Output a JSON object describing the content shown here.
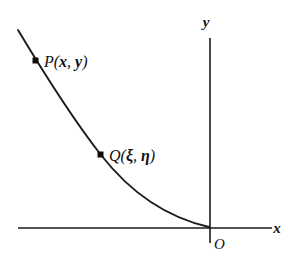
{
  "figure": {
    "background_color": "#ffffff",
    "ink_color": "#1a1a1a",
    "axes": {
      "x_axis_label": "x",
      "y_axis_label": "y",
      "origin_label": "O"
    },
    "curve": {
      "description": "decreasing convex curve",
      "style": "solid"
    },
    "points": [
      {
        "name": "P",
        "label_prefix": "P(",
        "first_coordinate": "x",
        "separator": ", ",
        "second_coordinate": "y",
        "label_suffix": ")"
      },
      {
        "name": "Q",
        "label_prefix": "Q(",
        "first_coordinate": "ξ",
        "separator": ", ",
        "second_coordinate": "η",
        "label_suffix": ")"
      }
    ]
  }
}
